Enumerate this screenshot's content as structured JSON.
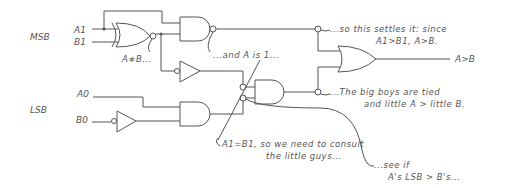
{
  "labels": {
    "msb": "MSB",
    "lsb": "LSB",
    "a1": "A1",
    "b1": "B1",
    "a0": "A0",
    "b0": "B0",
    "output": "A>B"
  },
  "annotations": {
    "xnor_note": "A≉B...",
    "and_note": "...and A is 1...",
    "settles_line1": "...so this settles it: since",
    "settles_line2": "A1>B1, A>B.",
    "tied_line1": "...The big boys are tied",
    "tied_line2": "and little A > little B.",
    "consult_line1": "A1=B1, so we need to consult",
    "consult_line2": "the little guys...",
    "seeif_line1": "...see if",
    "seeif_line2": "A's LSB > B's..."
  },
  "colors": {
    "ink": "#555555",
    "background": "#ffffff"
  }
}
